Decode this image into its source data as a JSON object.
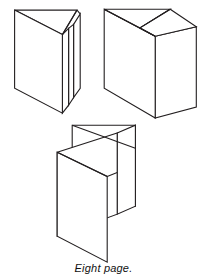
{
  "figure": {
    "caption": "Eight page.",
    "title": "Eight page.",
    "background_color": "#ffffff",
    "line_color": "#231f20",
    "line_width": 1.1,
    "panel_count": 3,
    "panels": [
      {
        "name": "parallel-fold-diagram",
        "label": "folded sheet, parallel fold, front-left view",
        "position": "top-left"
      },
      {
        "name": "accordion-fold-diagram",
        "label": "folded sheet, z / accordion fold",
        "position": "top-right"
      },
      {
        "name": "gate-fold-diagram",
        "label": "folded sheet, eight page fold, open view",
        "position": "bottom-center"
      }
    ]
  },
  "shapes": {
    "fig1": {
      "name": "parallel-fold-diagram",
      "outlines": [
        "M 14.5,10 L 77,10 L 77,27.5 L 14.5,30.5 Z",
        "M 14.5,30.5 L 14.5,88 L 62,113 L 62,34.5 Z",
        "M 62,34.5 L 62,113 L 68.5,105 L 68.5,28.5 Z",
        "M 68.5,28.5 L 68.5,105 L 73.5,97.5 L 73.5,24.5 Z",
        "M 73.5,24.5 L 73.5,97.5 L 80,88 L 80,14 Z"
      ],
      "lines": [
        "M 14.5,10 L 62,34.5",
        "M 62,34.5 L 77,10",
        "M 14.5,10 L 14.5,88",
        "M 14.5,88 L 62,113"
      ]
    },
    "fig2": {
      "name": "accordion-fold-diagram",
      "outlines": [
        "M 104,9 L 170,9 L 140,28 Z",
        "M 104,9 L 104,88 L 155,118 L 155,36 Z",
        "M 155,36 L 155,118 L 196,107 L 196,27 Z"
      ],
      "lines": [
        "M 104,9 L 155,36",
        "M 155,36 L 170,9",
        "M 140,28 L 170,9",
        "M 140,28 L 155,36"
      ]
    },
    "fig3": {
      "name": "gate-fold-diagram",
      "outlines": [
        "M 72,125 L 135,125 L 135,206 L 72,181 Z",
        "M 135,125 L 135,206 L 117,214 L 117,133 Z",
        "M 57,152 L 117,133 L 117,214 L 57,236 Z",
        "M 57,152 L 57,236 L 107,262 L 107,176 Z"
      ],
      "lines": [
        "M 72,125 L 135,148",
        "M 57,152 L 107,176",
        "M 107,176 L 117,171"
      ]
    }
  }
}
